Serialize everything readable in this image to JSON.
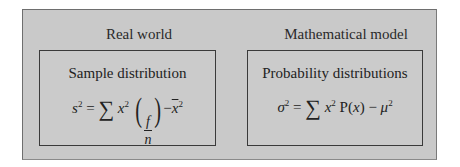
{
  "diagram": {
    "left": {
      "column_title": "Real world",
      "box_title": "Sample distribution",
      "formula": {
        "lhs": "s",
        "lhs_exp": "2",
        "equals": "=",
        "sum": "∑",
        "term": "x",
        "term_exp": "2",
        "frac_num": "f",
        "frac_den": "n",
        "minus": "−",
        "mean": "x",
        "mean_exp": "2",
        "paren_open": "(",
        "paren_close": ")"
      }
    },
    "right": {
      "column_title": "Mathematical model",
      "box_title": "Probability distributions",
      "formula": {
        "lhs": "σ",
        "lhs_exp": "2",
        "equals": " = ",
        "sum": "∑",
        "term": "x",
        "term_exp": "2",
        "prob": " P(",
        "prob_var": "x",
        "prob_close": ")",
        "minus": " − ",
        "mean": "μ",
        "mean_exp": "2"
      }
    }
  }
}
